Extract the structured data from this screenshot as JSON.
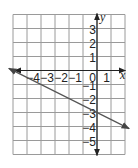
{
  "chart_data": {
    "type": "line",
    "title": "",
    "xlabel": "x",
    "ylabel": "y",
    "xlim": [
      -6,
      2
    ],
    "ylim": [
      -6,
      4
    ],
    "grid": true,
    "x_tick_labels": [
      "−4",
      "−3",
      "−2",
      "−1",
      "0",
      "1"
    ],
    "x_ticks": [
      -4,
      -3,
      -2,
      -1,
      0,
      1
    ],
    "y_tick_labels": [
      "3",
      "2",
      "1",
      "−1",
      "−2",
      "−3",
      "−4",
      "−5"
    ],
    "y_ticks": [
      3,
      2,
      1,
      -1,
      -2,
      -3,
      -4,
      -5
    ],
    "series": [
      {
        "name": "y = -1/2 x - 3",
        "equation": "y = -0.5x - 3",
        "slope": -0.5,
        "intercept": -3,
        "x": [
          -6.3,
          2.3
        ],
        "y": [
          0.15,
          -4.15
        ],
        "arrows_both_ends": true
      }
    ],
    "legend": null
  },
  "colors": {
    "grid": "#9a9a9a",
    "axis": "#222222",
    "line": "#555555",
    "background": "#ffffff"
  }
}
